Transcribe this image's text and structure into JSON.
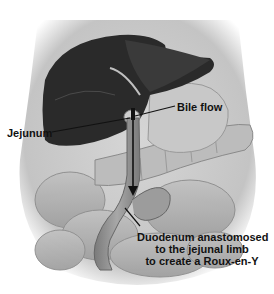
{
  "figure": {
    "labels": {
      "jejunum": "Jejunum",
      "bile_flow": "Bile flow",
      "duodenum": {
        "line1": "Duodenum anastomosed",
        "line2": "to the jejunal limb",
        "line3": "to create a Roux-en-Y"
      }
    },
    "colors": {
      "background": "#ffffff",
      "body_outline": "#c8c8c8",
      "liver": "#2a2a2a",
      "liver_highlight": "#4a4a4a",
      "intestine": "#b4b4b4",
      "intestine_dark": "#8a8a8a",
      "label_text": "#111111",
      "leader_line": "#111111"
    }
  }
}
